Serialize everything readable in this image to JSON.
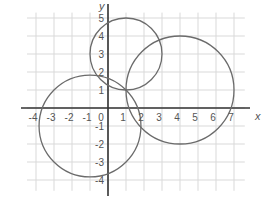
{
  "chart_data": {
    "type": "diagram",
    "title": "",
    "xlabel": "x",
    "ylabel": "y",
    "xlim": [
      -4,
      7
    ],
    "ylim": [
      -4,
      5
    ],
    "grid": true,
    "x_ticks": [
      "-4",
      "-3",
      "-2",
      "-1",
      "0",
      "1",
      "2",
      "3",
      "4",
      "5",
      "6",
      "7"
    ],
    "y_ticks": [
      "5",
      "4",
      "3",
      "2",
      "1",
      "-1",
      "-2",
      "-3",
      "-4"
    ],
    "circles": [
      {
        "name": "circle-a",
        "center": [
          1,
          3
        ],
        "radius": 2
      },
      {
        "name": "circle-b",
        "center": [
          4,
          1
        ],
        "radius": 3
      },
      {
        "name": "circle-c",
        "center": [
          -1,
          -1
        ],
        "radius": 2.83
      }
    ],
    "common_point": [
      1,
      1
    ]
  },
  "labels": {
    "x_axis": "x",
    "y_axis": "y",
    "origin": "0"
  },
  "colors": {
    "grid": "#d9d9d9",
    "axis": "#333333",
    "circle": "#6b6b6b",
    "text": "#555555"
  }
}
